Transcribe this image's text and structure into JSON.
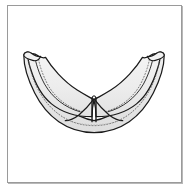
{
  "figure": {
    "view": "superior open view",
    "caption": "",
    "colors": {
      "page_background": "#ffffff",
      "card_background": "#ffffff",
      "card_border": "#9a9a9a",
      "card_shadow": "#b8b8b8",
      "leaflet_fill": "#ececec",
      "leaflet_fill_light": "#f4f4f4",
      "leaflet_fill_shade": "#e2e2e2",
      "outline_stroke": "#1a1a1a",
      "dotted_stroke": "#555555"
    },
    "stroke_widths": {
      "outline": 1.25,
      "inner_line": 1.0,
      "dotted": 0.8
    },
    "parts": [
      {
        "name": "left-leaflet",
        "label": ""
      },
      {
        "name": "right-leaflet",
        "label": ""
      },
      {
        "name": "left-wing-tip",
        "label": ""
      },
      {
        "name": "right-wing-tip",
        "label": ""
      },
      {
        "name": "central-commissure",
        "label": ""
      },
      {
        "name": "annulus-rim",
        "label": ""
      },
      {
        "name": "free-edge-stipple-left",
        "label": ""
      },
      {
        "name": "free-edge-stipple-right",
        "label": ""
      }
    ],
    "geometry": {
      "card_inset_left": 7,
      "card_inset_top": 5,
      "card_width": 175,
      "card_height": 178,
      "drawing_bbox": {
        "x": 22,
        "y": 52,
        "width": 150,
        "height": 78
      }
    }
  }
}
